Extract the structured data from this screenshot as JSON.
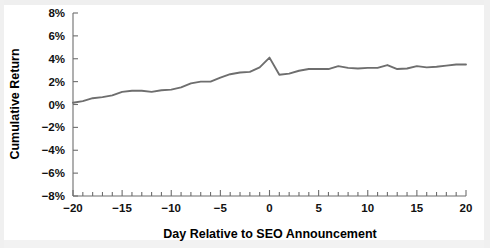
{
  "figure": {
    "background_color": "#ffffff",
    "line_color": "#6e6e6e",
    "axis_color": "#6d6d6d",
    "text_color": "#111111"
  },
  "chart_data": {
    "type": "line",
    "title": "",
    "xlabel": "Day Relative to SEO Announcement",
    "ylabel": "Cumulative Return",
    "xlim": [
      -20,
      20
    ],
    "ylim": [
      -8,
      8
    ],
    "grid": false,
    "legend": "none",
    "xticks": [
      -20,
      -15,
      -10,
      -5,
      0,
      5,
      10,
      15,
      20
    ],
    "xtick_labels": [
      "−20",
      "−15",
      "−10",
      "−5",
      "0",
      "5",
      "10",
      "15",
      "20"
    ],
    "xminor_tick_step": 1,
    "yticks": [
      -8,
      -6,
      -4,
      -2,
      0,
      2,
      4,
      6,
      8
    ],
    "ytick_labels": [
      "−8%",
      "−6%",
      "−4%",
      "−2%",
      "0%",
      "2%",
      "4%",
      "6%",
      "8%"
    ],
    "series": [
      {
        "name": "Cumulative Return",
        "color": "#6e6e6e",
        "x": [
          -20,
          -19,
          -18,
          -17,
          -16,
          -15,
          -14,
          -13,
          -12,
          -11,
          -10,
          -9,
          -8,
          -7,
          -6,
          -5,
          -4,
          -3,
          -2,
          -1,
          0,
          1,
          2,
          3,
          4,
          5,
          6,
          7,
          8,
          9,
          10,
          11,
          12,
          13,
          14,
          15,
          16,
          17,
          18,
          19,
          20
        ],
        "values": [
          0.15,
          0.3,
          0.55,
          0.65,
          0.8,
          1.1,
          1.2,
          1.2,
          1.1,
          1.25,
          1.3,
          1.5,
          1.85,
          2.0,
          2.0,
          2.35,
          2.65,
          2.8,
          2.85,
          3.25,
          4.1,
          2.6,
          2.7,
          2.95,
          3.1,
          3.1,
          3.1,
          3.35,
          3.2,
          3.15,
          3.2,
          3.2,
          3.45,
          3.1,
          3.15,
          3.35,
          3.25,
          3.3,
          3.4,
          3.5,
          3.5
        ]
      }
    ]
  }
}
